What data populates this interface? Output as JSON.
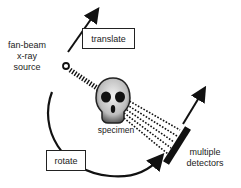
{
  "diagram": {
    "labels": {
      "source_line1": "fan-beam",
      "source_line2": "x-ray",
      "source_line3": "source",
      "translate": "translate",
      "rotate": "rotate",
      "specimen": "specimen",
      "detectors_line1": "multiple",
      "detectors_line2": "detectors"
    },
    "icons": {
      "specimen": "skull-icon",
      "source": "source-ring-icon",
      "detector": "detector-bar"
    },
    "colors": {
      "ink": "#111111",
      "background": "#ffffff",
      "skull_light": "#d9d9d9",
      "skull_dark": "#222222"
    }
  }
}
